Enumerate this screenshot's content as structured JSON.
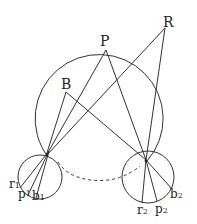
{
  "diagram": {
    "colors": {
      "line": "#333333",
      "text": "#222222",
      "background": "#ffffff"
    },
    "labels": {
      "P": "P",
      "R": "R",
      "B": "B",
      "r1": {
        "base": "r",
        "sub": "1"
      },
      "p1": {
        "base": "p",
        "sub": "1"
      },
      "b1": {
        "base": "b",
        "sub": "1"
      },
      "r2": {
        "base": "r",
        "sub": "2"
      },
      "p2": {
        "base": "p",
        "sub": "2"
      },
      "b2": {
        "base": "b",
        "sub": "2"
      }
    },
    "points": {
      "P": [
        106,
        50
      ],
      "R": [
        165,
        28
      ],
      "B": [
        66,
        92
      ],
      "left_focus": [
        46,
        156
      ],
      "right_focus": [
        146,
        160
      ]
    },
    "big_circle": {
      "cx": 102,
      "cy": 112,
      "r": 64
    },
    "left_circle": {
      "cx": 40,
      "cy": 176,
      "r": 22
    },
    "right_circle": {
      "cx": 148,
      "cy": 177,
      "r": 26
    },
    "dashed_arc": "connects left and right small circles below the big circle"
  }
}
